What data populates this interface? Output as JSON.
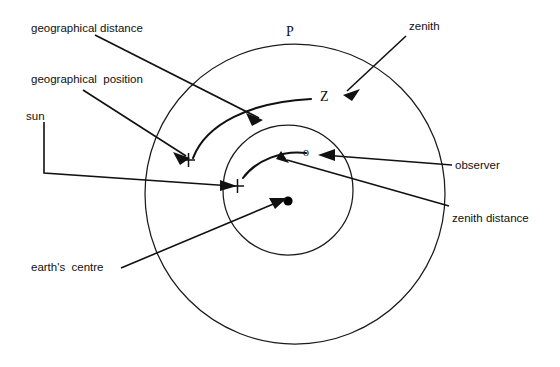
{
  "figure": {
    "kind": "astronomical-navigation-diagram",
    "background_color": "#ffffff",
    "ink_color": "#111111"
  },
  "labels": {
    "geographical_distance": "geographical distance",
    "geographical_position": "geographical  position",
    "sun": "sun",
    "earths_centre": "earth's  centre",
    "zenith": "zenith",
    "observer": "observer",
    "zenith_distance": "zenith distance"
  },
  "markers": {
    "pole": "P",
    "zenith_point": "Z",
    "observer_point": "o",
    "geographical_position_cross": "+",
    "sun_target_cross": "+"
  }
}
